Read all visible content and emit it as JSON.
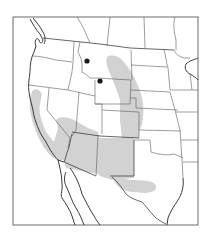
{
  "map": {
    "type": "species-range-map",
    "region": "Western United States and northern Mexico",
    "colors": {
      "background": "#ffffff",
      "frame": "#6a6a6a",
      "range_fill": "#d2d2d2",
      "coastline": "#3a3a3a",
      "state_borders": "#5a5a5a",
      "record_dots": "#1a1a1a"
    },
    "frame": {
      "x": 13,
      "y": 17,
      "width": 185,
      "height": 208
    },
    "range_areas": [
      {
        "name": "great-plains-band",
        "description": "Shaded band from central Montana south through eastern Wyoming, western Nebraska/Kansas, eastern Colorado"
      },
      {
        "name": "southwest-block",
        "description": "Shaded region covering California Central Valley/southern California, southern Nevada, southern Utah, Arizona, New Mexico"
      },
      {
        "name": "trans-pecos-texas",
        "description": "Shaded lobe in west Texas"
      }
    ],
    "record_points": [
      {
        "name": "montana-record",
        "x": 87,
        "y": 61
      },
      {
        "name": "wyoming-record",
        "x": 100,
        "y": 81
      }
    ]
  }
}
